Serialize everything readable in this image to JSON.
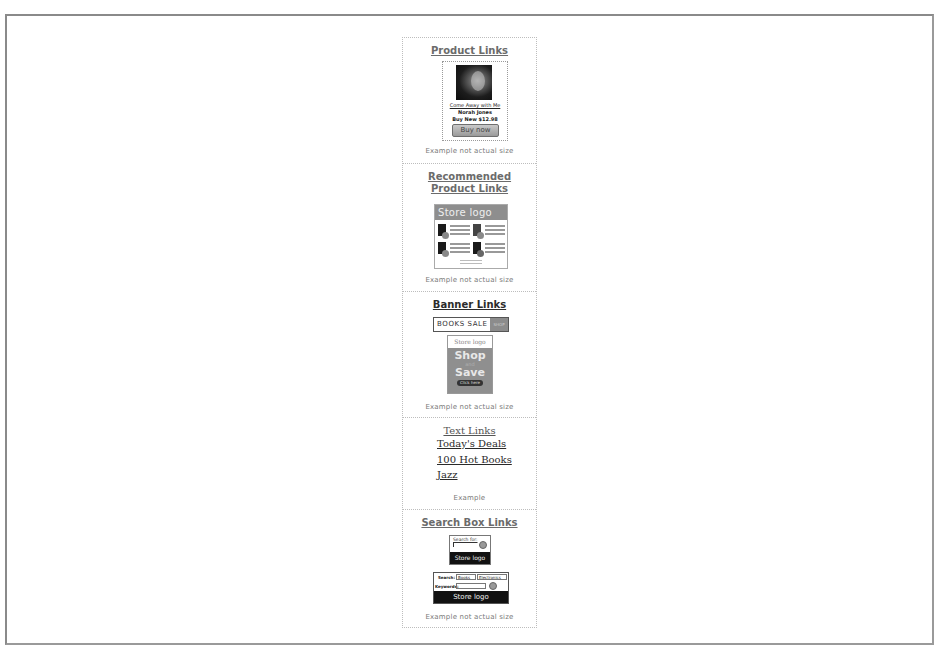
{
  "sections": {
    "product": {
      "title": "Product Links",
      "card": {
        "album_title": "Come Away with Me",
        "artist": "Norah Jones",
        "price": "Buy New $12.98",
        "button": "Buy now"
      },
      "caption": "Example not actual size"
    },
    "recommended": {
      "title": "Recommended Product Links",
      "store_logo": "Store logo",
      "caption": "Example not actual size"
    },
    "banner": {
      "title": "Banner Links",
      "horizontal_text": "BOOKS SALE",
      "horizontal_button": "SHOP",
      "vertical": {
        "logo": "Store logo",
        "line1": "Shop",
        "line2": "and",
        "line3": "Save",
        "button": "Click here"
      },
      "caption": "Example not actual size"
    },
    "text": {
      "title": "Text Links",
      "links": [
        "Today's Deals",
        "100 Hot Books",
        "Jazz"
      ],
      "caption": "Example"
    },
    "search": {
      "title": "Search Box Links",
      "small": {
        "label": "Search for:",
        "logo": "Store logo"
      },
      "large": {
        "search_label": "Search:",
        "category": "Books",
        "dropdown": "Electronics",
        "keywords_label": "Keywords:",
        "logo": "Store logo"
      },
      "caption": "Example not actual size"
    }
  }
}
